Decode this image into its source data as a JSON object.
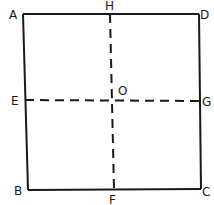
{
  "diagram": {
    "title": "",
    "points": {
      "A": {
        "label": "A",
        "x": 23,
        "y": 14
      },
      "D": {
        "label": "D",
        "x": 199,
        "y": 14
      },
      "B": {
        "label": "B",
        "x": 28,
        "y": 190
      },
      "C": {
        "label": "C",
        "x": 201,
        "y": 189
      },
      "H": {
        "label": "H",
        "x": 110,
        "y": 14
      },
      "F": {
        "label": "F",
        "x": 114,
        "y": 190
      },
      "E": {
        "label": "E",
        "x": 25,
        "y": 100
      },
      "G": {
        "label": "G",
        "x": 200,
        "y": 101
      },
      "O": {
        "label": "O",
        "x": 112,
        "y": 100
      }
    },
    "edges": [
      {
        "from": "A",
        "to": "D",
        "style": "solid"
      },
      {
        "from": "D",
        "to": "C",
        "style": "solid"
      },
      {
        "from": "C",
        "to": "B",
        "style": "solid"
      },
      {
        "from": "B",
        "to": "A",
        "style": "solid"
      },
      {
        "from": "H",
        "to": "F",
        "style": "dashed"
      },
      {
        "from": "E",
        "to": "G",
        "style": "dashed"
      }
    ],
    "colors": {
      "stroke": "#1a1a1a",
      "background": "#ffffff"
    }
  }
}
